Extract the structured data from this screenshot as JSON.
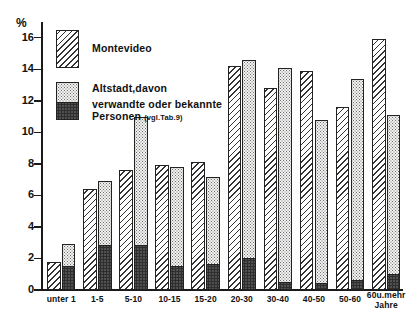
{
  "chart_data": {
    "type": "bar",
    "title": "",
    "subtitle": "",
    "xlabel": "Jahre",
    "ylabel": "%",
    "ylim": [
      0,
      17
    ],
    "grid": false,
    "legend_position": "top-left",
    "y_ticks": [
      0,
      2,
      4,
      6,
      8,
      10,
      12,
      14,
      16
    ],
    "y_tick_labels": [
      "0",
      "2",
      "4",
      "6",
      "8",
      "10",
      "12",
      "14",
      "16"
    ],
    "categories": [
      "unter 1",
      "1-5",
      "5-10",
      "10-15",
      "15-20",
      "20-30",
      "30-40",
      "40-50",
      "50-60",
      "60 u. mehr"
    ],
    "category_axis_suffix": "Jahre",
    "series": [
      {
        "name": "Montevideo",
        "fill": "hatch",
        "values": [
          1.8,
          6.4,
          7.6,
          7.9,
          8.1,
          14.2,
          12.8,
          13.9,
          11.6,
          15.9
        ]
      },
      {
        "name": "Altstadt, davon",
        "fill": "dots",
        "values": [
          2.9,
          6.9,
          11.0,
          7.8,
          7.2,
          14.6,
          14.1,
          10.8,
          13.4,
          11.1
        ]
      },
      {
        "name": "verwandte oder bekannte Personen",
        "fill": "dark",
        "note": "(vgl.Tab.9)",
        "values": [
          1.4,
          2.7,
          2.7,
          1.4,
          1.5,
          1.9,
          0.35,
          0.3,
          0.5,
          0.9
        ]
      }
    ]
  },
  "legend": {
    "items": [
      {
        "label": "Montevideo",
        "fill": "hatch"
      },
      {
        "label": "Altstadt,davon",
        "fill": "dots"
      },
      {
        "label": "verwandte oder bekannte",
        "label2": "Personen",
        "note": "(vgl.Tab.9)",
        "fill": "dark"
      }
    ]
  },
  "axis": {
    "y_unit": "%",
    "x_unit_line1": "60u.mehr",
    "x_unit_line2": "Jahre"
  }
}
